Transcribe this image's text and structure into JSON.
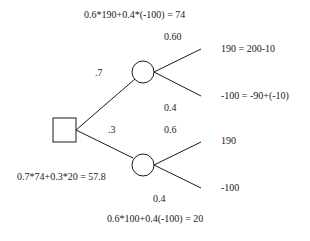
{
  "diagram": {
    "type": "decision-tree",
    "decision_node": {
      "shape": "square",
      "id": "root"
    },
    "formulas": {
      "top": "0.6*190+0.4*(-100) = 74",
      "root": "0.7*74+0.3*20 = 57.8",
      "bottom": "0.6*100+0.4(-100) = 20"
    },
    "branches": [
      {
        "probability": ".7",
        "chance_node": "upper",
        "outcomes": [
          {
            "probability": "0.60",
            "payoff": "190 = 200-10"
          },
          {
            "probability": "0.4",
            "payoff": "-100 = -90+(-10)"
          }
        ]
      },
      {
        "probability": ".3",
        "chance_node": "lower",
        "outcomes": [
          {
            "probability": "0.6",
            "payoff": "190"
          },
          {
            "probability": "0.4",
            "payoff": "-100"
          }
        ]
      }
    ],
    "colors": {
      "stroke": "#1a1a1a",
      "background": "#ffffff"
    }
  }
}
